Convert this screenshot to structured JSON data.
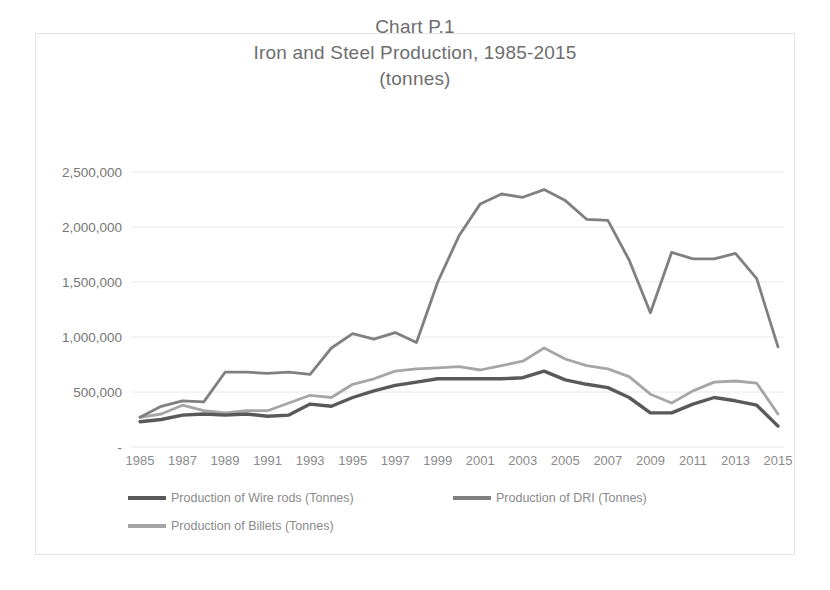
{
  "chart_data": {
    "type": "line",
    "title": "Chart P.1",
    "title_lines": [
      "Chart P.1",
      "Iron and Steel Production, 1985-2015",
      "(tonnes)"
    ],
    "subtitle": "Iron and Steel Production, 1985-2015",
    "units": "(tonnes)",
    "xlabel": "",
    "ylabel": "",
    "grid": true,
    "legend_position": "bottom",
    "ylim": [
      0,
      2500000
    ],
    "ytick_labels": [
      "2,500,000",
      "2,000,000",
      "1,500,000",
      "1,000,000",
      "500,000",
      "-"
    ],
    "ytick_values": [
      2500000,
      2000000,
      1500000,
      1000000,
      500000,
      0
    ],
    "xtick_labels": [
      "1985",
      "1987",
      "1989",
      "1991",
      "1993",
      "1995",
      "1997",
      "1999",
      "2001",
      "2003",
      "2005",
      "2007",
      "2009",
      "2011",
      "2013",
      "2015"
    ],
    "x": [
      1985,
      1986,
      1987,
      1988,
      1989,
      1990,
      1991,
      1992,
      1993,
      1994,
      1995,
      1996,
      1997,
      1998,
      1999,
      2000,
      2001,
      2002,
      2003,
      2004,
      2005,
      2006,
      2007,
      2008,
      2009,
      2010,
      2011,
      2012,
      2013,
      2014,
      2015
    ],
    "series": [
      {
        "name": "Production of Wire rods (Tonnes)",
        "color": "#595959",
        "values": [
          230000,
          250000,
          290000,
          300000,
          290000,
          300000,
          280000,
          290000,
          390000,
          370000,
          450000,
          510000,
          560000,
          590000,
          620000,
          620000,
          620000,
          620000,
          630000,
          690000,
          610000,
          570000,
          540000,
          450000,
          310000,
          310000,
          390000,
          450000,
          420000,
          380000,
          190000
        ]
      },
      {
        "name": "Production of DRI (Tonnes)",
        "color": "#808080",
        "values": [
          270000,
          370000,
          420000,
          410000,
          680000,
          680000,
          670000,
          680000,
          660000,
          900000,
          1030000,
          980000,
          1040000,
          950000,
          1500000,
          1920000,
          2210000,
          2300000,
          2270000,
          2340000,
          2240000,
          2070000,
          2060000,
          1700000,
          1220000,
          1770000,
          1710000,
          1710000,
          1760000,
          1530000,
          910000
        ]
      },
      {
        "name": "Production of Billets (Tonnes)",
        "color": "#a6a6a6",
        "values": [
          270000,
          300000,
          380000,
          330000,
          310000,
          330000,
          330000,
          400000,
          470000,
          450000,
          570000,
          620000,
          690000,
          710000,
          720000,
          730000,
          700000,
          740000,
          780000,
          900000,
          800000,
          740000,
          710000,
          640000,
          480000,
          400000,
          510000,
          590000,
          600000,
          580000,
          300000
        ]
      }
    ]
  },
  "legend": {
    "items": [
      {
        "label": "Production of Wire rods (Tonnes)",
        "color": "#595959"
      },
      {
        "label": "Production of DRI (Tonnes)",
        "color": "#808080"
      },
      {
        "label": "Production of Billets (Tonnes)",
        "color": "#a6a6a6"
      }
    ]
  }
}
